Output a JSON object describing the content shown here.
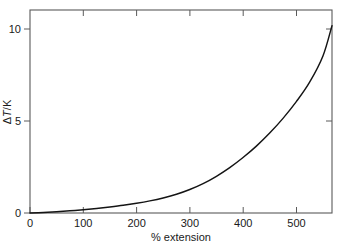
{
  "figure": {
    "background_color": "#ffffff",
    "line_color": "#141414",
    "axis_color": "#5a5a5a"
  },
  "chart_data": {
    "type": "line",
    "title": "",
    "subtitle": "",
    "xlabel": "% extension",
    "ylabel": "ΔT/K",
    "ylabel_parts": {
      "delta": "Δ",
      "variable": "T",
      "unit": "/K"
    },
    "xlim": [
      0,
      567
    ],
    "ylim": [
      0,
      11.05
    ],
    "xticks": [
      0,
      100,
      200,
      300,
      400,
      500
    ],
    "xtick_labels": [
      "0",
      "100",
      "200",
      "300",
      "400",
      "500"
    ],
    "yticks": [
      0,
      5,
      10
    ],
    "ytick_labels": [
      "0",
      "5",
      "10"
    ],
    "grid": false,
    "legend": false,
    "tick_direction": "in",
    "frame": "full-box",
    "series": [
      {
        "name": "ΔT",
        "x": [
          0,
          25,
          50,
          75,
          100,
          125,
          150,
          175,
          200,
          225,
          250,
          275,
          300,
          325,
          350,
          375,
          400,
          425,
          450,
          475,
          500,
          525,
          550,
          567
        ],
        "values": [
          0.0,
          0.03,
          0.07,
          0.12,
          0.18,
          0.25,
          0.33,
          0.42,
          0.53,
          0.66,
          0.82,
          1.02,
          1.28,
          1.6,
          2.0,
          2.47,
          3.02,
          3.64,
          4.35,
          5.15,
          6.06,
          7.12,
          8.55,
          10.2
        ]
      }
    ],
    "annotations": []
  },
  "axes_geometry": {
    "plot_left_px": 30,
    "plot_right_px": 332,
    "plot_top_px": 10,
    "plot_bottom_px": 213
  }
}
